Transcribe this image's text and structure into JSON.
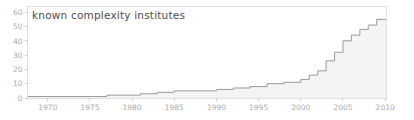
{
  "chart": {
    "title": "known complexity institutes"
  },
  "chart_data": {
    "type": "area",
    "subtype": "step",
    "title": "known complexity institutes",
    "xlabel": "",
    "ylabel": "",
    "legend": "none",
    "grid": false,
    "x_ticks": [
      1970,
      1975,
      1980,
      1985,
      1990,
      1995,
      2000,
      2005,
      2010
    ],
    "y_ticks": [
      0,
      10,
      20,
      30,
      40,
      50,
      60
    ],
    "xlim": [
      1967.6,
      2010.1
    ],
    "ylim": [
      0,
      64
    ],
    "series": [
      {
        "name": "known complexity institutes",
        "points": [
          {
            "year": 1967,
            "count": 1
          },
          {
            "year": 1977,
            "count": 2
          },
          {
            "year": 1981,
            "count": 3
          },
          {
            "year": 1983,
            "count": 4
          },
          {
            "year": 1985,
            "count": 5
          },
          {
            "year": 1990,
            "count": 6
          },
          {
            "year": 1992,
            "count": 7
          },
          {
            "year": 1994,
            "count": 8
          },
          {
            "year": 1996,
            "count": 10
          },
          {
            "year": 1998,
            "count": 11
          },
          {
            "year": 2000,
            "count": 13
          },
          {
            "year": 2001,
            "count": 16
          },
          {
            "year": 2002,
            "count": 19
          },
          {
            "year": 2003,
            "count": 26
          },
          {
            "year": 2004,
            "count": 32
          },
          {
            "year": 2005,
            "count": 40
          },
          {
            "year": 2006,
            "count": 44
          },
          {
            "year": 2007,
            "count": 48
          },
          {
            "year": 2008,
            "count": 51
          },
          {
            "year": 2009,
            "count": 55
          }
        ]
      }
    ],
    "colors": {
      "line": "#999999",
      "fill": "#f4f4f2",
      "spine": "#e0e0e0",
      "tick_mark": "#cccccc",
      "tick_label": "#aaaaaa",
      "title": "#4d4d4d",
      "background": "#ffffff"
    }
  }
}
